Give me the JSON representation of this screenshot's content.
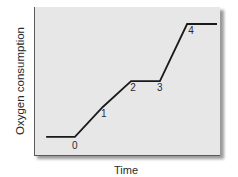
{
  "chart_data": {
    "type": "line",
    "title": "",
    "xlabel": "Time",
    "ylabel": "Oxygen consumption",
    "grid": false,
    "legend": null,
    "axis_ticks": "none",
    "ylim": [
      0,
      100
    ],
    "xlim": [
      0,
      100
    ],
    "series": [
      {
        "name": "Oxygen consumption",
        "color": "#1a1a1a",
        "points": [
          {
            "x": 6.5,
            "y": 12.8,
            "label": ""
          },
          {
            "x": 22.0,
            "y": 12.8,
            "label": "0"
          },
          {
            "x": 37.0,
            "y": 32.9,
            "label": "1"
          },
          {
            "x": 52.2,
            "y": 50.3,
            "label": "2"
          },
          {
            "x": 67.7,
            "y": 50.3,
            "label": "3"
          },
          {
            "x": 82.3,
            "y": 88.6,
            "label": "4"
          },
          {
            "x": 98.4,
            "y": 88.6,
            "label": ""
          }
        ]
      }
    ],
    "annotations": [
      "0",
      "1",
      "2",
      "3",
      "4"
    ]
  },
  "labels": {
    "x_axis": "Time",
    "y_axis": "Oxygen consumption",
    "points": [
      "0",
      "1",
      "2",
      "3",
      "4"
    ]
  },
  "colors": {
    "plot_background": "#e7e7e7",
    "line": "#1a1a1a",
    "axis": "#5a5a5a"
  }
}
